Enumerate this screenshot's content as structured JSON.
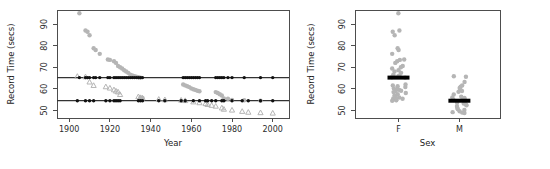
{
  "figure": {
    "background": "#ffffff",
    "point_color_gray": "#b5b5b5",
    "point_color_black": "#111111",
    "axis_color": "#4d4d4d"
  },
  "chart_data": [
    {
      "type": "scatter",
      "panel": "left",
      "title": "",
      "xlabel": "Year",
      "ylabel": "Record Time (secs)",
      "xlim": [
        1894,
        2008
      ],
      "ylim": [
        46.5,
        96.5
      ],
      "xticks": [
        1900,
        1920,
        1940,
        1960,
        1980,
        2000
      ],
      "xticklabels": [
        "1900",
        "1920",
        "1940",
        "1960",
        "1980",
        "2000"
      ],
      "yticks": [
        50,
        60,
        70,
        80,
        90
      ],
      "yticklabels": [
        "50",
        "60",
        "70",
        "80",
        "90"
      ],
      "grid": false,
      "legend": "none",
      "hlines": [
        {
          "y": 65.2,
          "label": "F median record time",
          "color": "#333333"
        },
        {
          "y": 54.5,
          "label": "M median record time",
          "color": "#333333"
        }
      ],
      "series": [
        {
          "name": "Female records",
          "marker": "circle",
          "color": "#b5b5b5",
          "points": [
            [
              1905,
              95.0
            ],
            [
              1908,
              87.0
            ],
            [
              1909,
              86.4
            ],
            [
              1910,
              84.8
            ],
            [
              1912,
              78.8
            ],
            [
              1913,
              78.0
            ],
            [
              1915,
              76.2
            ],
            [
              1919,
              73.6
            ],
            [
              1920,
              73.4
            ],
            [
              1922,
              72.8
            ],
            [
              1923,
              72.0
            ],
            [
              1924,
              70.6
            ],
            [
              1925,
              70.0
            ],
            [
              1926,
              69.4
            ],
            [
              1927,
              68.6
            ],
            [
              1928,
              68.0
            ],
            [
              1929,
              67.4
            ],
            [
              1930,
              66.6
            ],
            [
              1931,
              66.2
            ],
            [
              1932,
              65.8
            ],
            [
              1933,
              65.6
            ],
            [
              1934,
              65.4
            ],
            [
              1935,
              65.2
            ],
            [
              1935,
              56.0
            ],
            [
              1936,
              55.8
            ],
            [
              1956,
              62.0
            ],
            [
              1957,
              61.6
            ],
            [
              1958,
              61.2
            ],
            [
              1959,
              60.8
            ],
            [
              1960,
              60.2
            ],
            [
              1961,
              59.8
            ],
            [
              1962,
              59.5
            ],
            [
              1963,
              59.1
            ],
            [
              1964,
              58.9
            ],
            [
              1972,
              58.5
            ],
            [
              1973,
              58.1
            ],
            [
              1974,
              57.5
            ],
            [
              1975,
              56.9
            ],
            [
              1976,
              55.6
            ],
            [
              1978,
              55.4
            ],
            [
              1980,
              54.8
            ],
            [
              1986,
              54.7
            ],
            [
              1994,
              54.5
            ]
          ]
        },
        {
          "name": "Male records",
          "marker": "triangle",
          "color": "#b5b5b5",
          "points": [
            [
              1904,
              65.8
            ],
            [
              1908,
              65.6
            ],
            [
              1910,
              63.2
            ],
            [
              1912,
              61.6
            ],
            [
              1918,
              61.0
            ],
            [
              1920,
              60.4
            ],
            [
              1922,
              59.6
            ],
            [
              1923,
              59.0
            ],
            [
              1924,
              58.6
            ],
            [
              1925,
              57.4
            ],
            [
              1934,
              56.4
            ],
            [
              1935,
              56.0
            ],
            [
              1936,
              55.8
            ],
            [
              1944,
              55.2
            ],
            [
              1947,
              55.0
            ],
            [
              1955,
              54.8
            ],
            [
              1957,
              54.6
            ],
            [
              1961,
              54.0
            ],
            [
              1964,
              53.6
            ],
            [
              1967,
              53.2
            ],
            [
              1968,
              52.8
            ],
            [
              1970,
              52.4
            ],
            [
              1972,
              52.0
            ],
            [
              1975,
              51.2
            ],
            [
              1976,
              50.6
            ],
            [
              1980,
              50.2
            ],
            [
              1985,
              49.6
            ],
            [
              1988,
              49.2
            ],
            [
              1994,
              49.0
            ],
            [
              2000,
              48.8
            ]
          ]
        },
        {
          "name": "Female median marker",
          "marker": "dot",
          "color": "#111111",
          "points": [
            [
              1905,
              65.2
            ],
            [
              1908,
              65.2
            ],
            [
              1909,
              65.2
            ],
            [
              1910,
              65.2
            ],
            [
              1912,
              65.2
            ],
            [
              1913,
              65.2
            ],
            [
              1915,
              65.2
            ],
            [
              1919,
              65.2
            ],
            [
              1920,
              65.2
            ],
            [
              1922,
              65.2
            ],
            [
              1923,
              65.2
            ],
            [
              1924,
              65.2
            ],
            [
              1925,
              65.2
            ],
            [
              1926,
              65.2
            ],
            [
              1927,
              65.2
            ],
            [
              1928,
              65.2
            ],
            [
              1929,
              65.2
            ],
            [
              1930,
              65.2
            ],
            [
              1931,
              65.2
            ],
            [
              1932,
              65.2
            ],
            [
              1933,
              65.2
            ],
            [
              1934,
              65.2
            ],
            [
              1935,
              65.2
            ],
            [
              1936,
              65.2
            ],
            [
              1956,
              65.2
            ],
            [
              1957,
              65.2
            ],
            [
              1958,
              65.2
            ],
            [
              1959,
              65.2
            ],
            [
              1960,
              65.2
            ],
            [
              1961,
              65.2
            ],
            [
              1962,
              65.2
            ],
            [
              1963,
              65.2
            ],
            [
              1964,
              65.2
            ],
            [
              1972,
              65.2
            ],
            [
              1973,
              65.2
            ],
            [
              1974,
              65.2
            ],
            [
              1975,
              65.2
            ],
            [
              1976,
              65.2
            ],
            [
              1978,
              65.2
            ],
            [
              1980,
              65.2
            ],
            [
              1986,
              65.2
            ],
            [
              1994,
              65.2
            ],
            [
              2000,
              65.2
            ]
          ]
        },
        {
          "name": "Male median marker",
          "marker": "dot",
          "color": "#111111",
          "points": [
            [
              1904,
              54.5
            ],
            [
              1908,
              54.5
            ],
            [
              1910,
              54.5
            ],
            [
              1912,
              54.5
            ],
            [
              1918,
              54.5
            ],
            [
              1920,
              54.5
            ],
            [
              1922,
              54.5
            ],
            [
              1923,
              54.5
            ],
            [
              1924,
              54.5
            ],
            [
              1925,
              54.5
            ],
            [
              1934,
              54.5
            ],
            [
              1935,
              54.5
            ],
            [
              1936,
              54.5
            ],
            [
              1944,
              54.5
            ],
            [
              1947,
              54.5
            ],
            [
              1955,
              54.5
            ],
            [
              1957,
              54.5
            ],
            [
              1961,
              54.5
            ],
            [
              1964,
              54.5
            ],
            [
              1967,
              54.5
            ],
            [
              1968,
              54.5
            ],
            [
              1970,
              54.5
            ],
            [
              1972,
              54.5
            ],
            [
              1975,
              54.5
            ],
            [
              1976,
              54.5
            ],
            [
              1980,
              54.5
            ],
            [
              1985,
              54.5
            ],
            [
              1988,
              54.5
            ],
            [
              1994,
              54.5
            ],
            [
              2000,
              54.5
            ]
          ]
        }
      ]
    },
    {
      "type": "scatter",
      "panel": "right",
      "title": "",
      "xlabel": "Sex",
      "ylabel": "Record Time (secs)",
      "categories": [
        "F",
        "M"
      ],
      "ylim": [
        46.5,
        96.5
      ],
      "yticks": [
        50,
        60,
        70,
        80,
        90
      ],
      "yticklabels": [
        "50",
        "60",
        "70",
        "80",
        "90"
      ],
      "grid": false,
      "legend": "none",
      "medians": [
        {
          "category": "F",
          "value": 65.2
        },
        {
          "category": "M",
          "value": 54.5
        }
      ],
      "series": [
        {
          "name": "F",
          "marker": "circle",
          "color": "#b5b5b5",
          "values": [
            95.0,
            87.0,
            86.4,
            84.8,
            78.8,
            78.0,
            76.2,
            73.6,
            73.4,
            72.8,
            72.0,
            70.6,
            70.0,
            69.4,
            68.6,
            68.0,
            67.4,
            66.6,
            66.2,
            65.8,
            65.6,
            65.4,
            65.2,
            62.0,
            61.6,
            61.2,
            60.8,
            60.2,
            59.8,
            59.5,
            59.1,
            58.9,
            58.5,
            58.1,
            57.5,
            56.9,
            56.0,
            55.8,
            55.6,
            55.4,
            54.8,
            54.7,
            54.5
          ]
        },
        {
          "name": "M",
          "marker": "circle",
          "color": "#b5b5b5",
          "values": [
            65.8,
            65.6,
            63.2,
            61.6,
            61.0,
            60.4,
            59.6,
            59.0,
            58.6,
            57.4,
            56.4,
            56.0,
            55.8,
            55.2,
            55.0,
            54.8,
            54.6,
            54.0,
            53.6,
            53.2,
            52.8,
            52.4,
            52.0,
            51.2,
            50.6,
            50.2,
            49.6,
            49.2,
            49.0,
            48.8
          ]
        }
      ]
    }
  ],
  "left_panel": {
    "ylabel": "Record Time (secs)",
    "xlabel": "Year",
    "xticklabels": [
      "1900",
      "1920",
      "1940",
      "1960",
      "1980",
      "2000"
    ],
    "yticklabels": [
      "50",
      "60",
      "70",
      "80",
      "90"
    ]
  },
  "right_panel": {
    "ylabel": "Record Time (secs)",
    "xlabel": "Sex",
    "xticklabels": [
      "F",
      "M"
    ],
    "yticklabels": [
      "50",
      "60",
      "70",
      "80",
      "90"
    ]
  }
}
